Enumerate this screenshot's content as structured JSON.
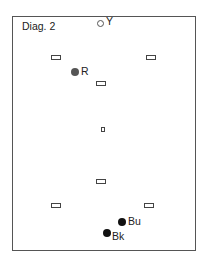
{
  "diagram": {
    "title": "Diag. 2",
    "balls": [
      {
        "id": "yellow",
        "label": "Y",
        "style": "open",
        "color": "#ffffff"
      },
      {
        "id": "red",
        "label": "R",
        "style": "filled",
        "color": "#555555"
      },
      {
        "id": "blue",
        "label": "Bu",
        "style": "filled",
        "color": "#111111"
      },
      {
        "id": "black",
        "label": "Bk",
        "style": "filled",
        "color": "#111111"
      }
    ],
    "spot_markers": [
      "top-left",
      "top-right",
      "upper-center",
      "center",
      "lower-center",
      "bottom-left",
      "bottom-right"
    ]
  }
}
